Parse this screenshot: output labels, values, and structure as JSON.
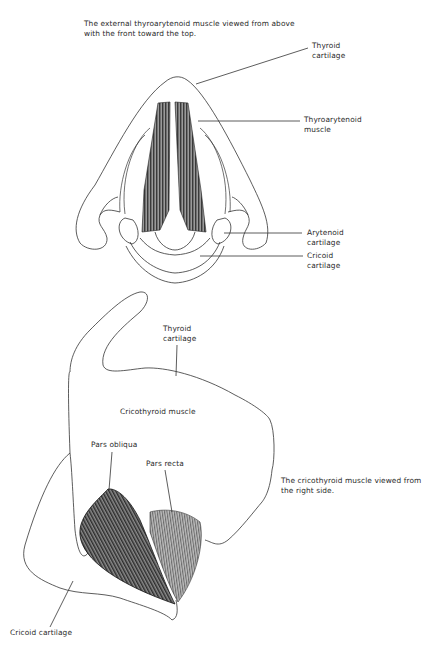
{
  "top_figure": {
    "caption": "The external thyroarytenoid muscle viewed from above\nwith the front toward the top.",
    "labels": {
      "thyroid_cartilage": "Thyroid\ncartilage",
      "thyroarytenoid_muscle": "Thyroarytenoid\nmuscle",
      "arytenoid_cartilage": "Arytenoid\ncartilage",
      "cricoid_cartilage": "Cricoid\ncartilage"
    }
  },
  "bottom_figure": {
    "caption": "The cricothyroid muscle viewed from\nthe right side.",
    "labels": {
      "thyroid_cartilage": "Thyroid\ncartilage",
      "cricothyroid_muscle": "Cricothyroid muscle",
      "pars_obliqua": "Pars obliqua",
      "pars_recta": "Pars recta",
      "cricoid_cartilage": "Cricoid cartilage"
    }
  },
  "colors": {
    "line": "#333333",
    "muscle_dark": "#1a1a1a",
    "muscle_mid": "#777777",
    "background": "#ffffff"
  }
}
